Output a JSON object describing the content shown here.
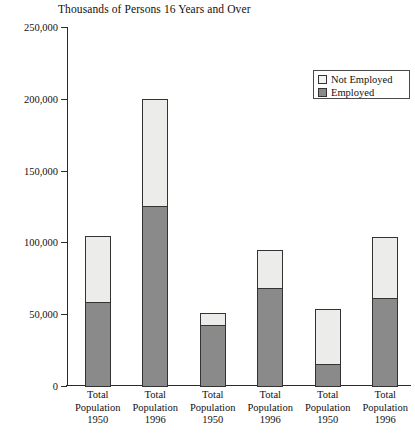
{
  "chart_data": {
    "type": "bar",
    "title": "Thousands of Persons 16 Years and Over",
    "xlabel": "",
    "ylabel": "",
    "stacked": true,
    "grid": false,
    "legend_position": "top-right",
    "ylim": [
      0,
      250000
    ],
    "y_ticks": [
      0,
      50000,
      100000,
      150000,
      200000,
      250000
    ],
    "y_tick_labels": [
      "0",
      "50,000",
      "100,000",
      "150,000",
      "200,000",
      "250,000"
    ],
    "categories": [
      "Total Population 1950",
      "Total Population 1996",
      "Total Population 1950",
      "Total Population 1996",
      "Total Population 1950",
      "Total Population 1996"
    ],
    "category_lines": [
      [
        "Total",
        "Population",
        "1950"
      ],
      [
        "Total",
        "Population",
        "1996"
      ],
      [
        "Total",
        "Population",
        "1950"
      ],
      [
        "Total",
        "Population",
        "1996"
      ],
      [
        "Total",
        "Population",
        "1950"
      ],
      [
        "Total",
        "Population",
        "1996"
      ]
    ],
    "series": [
      {
        "name": "Employed",
        "color": "#8a8a8a",
        "values": [
          59000,
          126000,
          43000,
          69000,
          16000,
          62000
        ]
      },
      {
        "name": "Not Employed",
        "color": "#ececeb",
        "values": [
          47000,
          75000,
          9000,
          27000,
          39000,
          43000
        ]
      }
    ],
    "totals": [
      106000,
      201000,
      52000,
      96000,
      55000,
      105000
    ],
    "legend": [
      {
        "label": "Not Employed",
        "color": "#ececeb"
      },
      {
        "label": "Employed",
        "color": "#8a8a8a"
      }
    ]
  }
}
